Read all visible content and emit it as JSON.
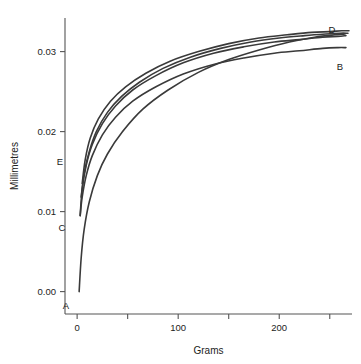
{
  "chart_data": {
    "type": "line",
    "title": "",
    "xlabel": "Grams",
    "ylabel": "Millimetres",
    "xlim": [
      -12,
      272
    ],
    "ylim": [
      -0.0028,
      0.0342
    ],
    "grid": false,
    "legend_position": "none",
    "xticks": [
      0,
      50,
      100,
      150,
      200,
      250
    ],
    "xtick_labels": [
      "0",
      "",
      "100",
      "",
      "200",
      ""
    ],
    "yticks": [
      0.0,
      0.01,
      0.02,
      0.03
    ],
    "ytick_labels": [
      "0.00",
      "0.01",
      "0.02",
      "0.03"
    ],
    "line_color": "#3a3a3a",
    "axis_color": "#555555",
    "series": [
      {
        "name": "A",
        "label": "A",
        "label_position": "start-below",
        "x": [
          2,
          4,
          7,
          12,
          20,
          30,
          45,
          65,
          90,
          120,
          150,
          180,
          210,
          235,
          255,
          265
        ],
        "y": [
          0.0,
          0.0042,
          0.0078,
          0.0112,
          0.0145,
          0.0172,
          0.02,
          0.0228,
          0.0252,
          0.0274,
          0.029,
          0.0302,
          0.0312,
          0.0318,
          0.0321,
          0.0322
        ]
      },
      {
        "name": "B",
        "label": "B",
        "label_position": "end-below",
        "x": [
          3,
          5,
          9,
          15,
          25,
          38,
          55,
          78,
          105,
          135,
          165,
          195,
          220,
          243,
          258,
          266
        ],
        "y": [
          0.0095,
          0.0118,
          0.0145,
          0.017,
          0.0196,
          0.0218,
          0.0238,
          0.0256,
          0.0272,
          0.0284,
          0.0292,
          0.0298,
          0.0301,
          0.0304,
          0.0305,
          0.0305
        ]
      },
      {
        "name": "C",
        "label": "C",
        "label_position": "start-below",
        "x": [
          3,
          5,
          9,
          15,
          25,
          38,
          55,
          78,
          105,
          135,
          165,
          195,
          220,
          243,
          258,
          266
        ],
        "y": [
          0.0095,
          0.0128,
          0.0158,
          0.0184,
          0.021,
          0.0232,
          0.0252,
          0.027,
          0.0286,
          0.0298,
          0.0306,
          0.0312,
          0.0315,
          0.0318,
          0.0319,
          0.032
        ]
      },
      {
        "name": "D",
        "label": "D",
        "label_position": "end-above",
        "x": [
          4,
          7,
          12,
          19,
          30,
          44,
          62,
          85,
          112,
          142,
          172,
          200,
          225,
          246,
          260,
          268
        ],
        "y": [
          0.0118,
          0.0148,
          0.0175,
          0.02,
          0.0224,
          0.0244,
          0.0262,
          0.0279,
          0.0293,
          0.0304,
          0.0312,
          0.0317,
          0.032,
          0.0322,
          0.0323,
          0.0323
        ]
      },
      {
        "name": "E",
        "label": "E",
        "label_position": "start-left",
        "x": [
          5,
          8,
          13,
          21,
          33,
          48,
          68,
          92,
          120,
          150,
          180,
          208,
          232,
          250,
          262,
          269
        ],
        "y": [
          0.0135,
          0.0165,
          0.0192,
          0.0216,
          0.0238,
          0.0256,
          0.0273,
          0.0288,
          0.03,
          0.031,
          0.0317,
          0.0321,
          0.0324,
          0.0325,
          0.0326,
          0.0326
        ]
      }
    ],
    "point_labels": [
      {
        "text": "A",
        "x_px": 66,
        "y_px": 309
      },
      {
        "text": "B",
        "x_px": 340,
        "y_px": 70
      },
      {
        "text": "C",
        "x_px": 62,
        "y_px": 231
      },
      {
        "text": "D",
        "x_px": 332,
        "y_px": 33
      },
      {
        "text": "E",
        "x_px": 60,
        "y_px": 165
      }
    ]
  }
}
